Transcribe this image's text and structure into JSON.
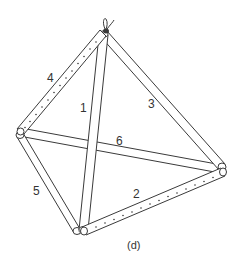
{
  "figure": {
    "caption": "(d)",
    "colors": {
      "stroke": "#3a3a3a",
      "background": "#ffffff",
      "text": "#333333"
    },
    "vertices": {
      "apex": [
        104,
        33
      ],
      "left": [
        20,
        132
      ],
      "right": [
        220,
        170
      ],
      "bottom": [
        78,
        233
      ]
    },
    "rods": [
      {
        "id": "1",
        "label": "1",
        "from": "apex",
        "to": "bottom",
        "perforated": false
      },
      {
        "id": "2",
        "label": "2",
        "from": "bottom",
        "to": "right",
        "perforated": true
      },
      {
        "id": "3",
        "label": "3",
        "from": "apex",
        "to": "right",
        "perforated": false
      },
      {
        "id": "4",
        "label": "4",
        "from": "apex",
        "to": "left",
        "perforated": true
      },
      {
        "id": "5",
        "label": "5",
        "from": "left",
        "to": "bottom",
        "perforated": false
      },
      {
        "id": "6",
        "label": "6",
        "from": "left",
        "to": "right",
        "perforated": false
      }
    ],
    "labels": {
      "rod_1": "1",
      "rod_2": "2",
      "rod_3": "3",
      "rod_4": "4",
      "rod_5": "5",
      "rod_6": "6"
    },
    "hanger": "wire-loop"
  }
}
